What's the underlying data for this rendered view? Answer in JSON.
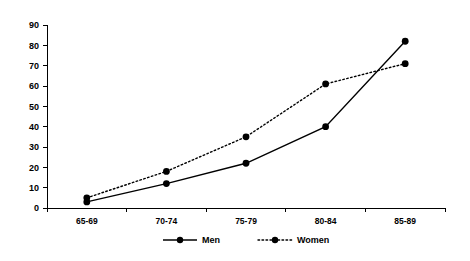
{
  "chart_data": {
    "type": "line",
    "title": "",
    "xlabel": "",
    "ylabel": "",
    "categories": [
      "65-69",
      "70-74",
      "75-79",
      "80-84",
      "85-89"
    ],
    "series": [
      {
        "name": "Men",
        "values": [
          3,
          12,
          22,
          40,
          82
        ],
        "style": "solid",
        "marker": "filled-circle",
        "color": "#000000"
      },
      {
        "name": "Women",
        "values": [
          5,
          18,
          35,
          61,
          71
        ],
        "style": "dotted",
        "marker": "filled-circle",
        "color": "#000000"
      }
    ],
    "ylim": [
      0,
      90
    ],
    "ytick_labels": [
      "0",
      "10",
      "20",
      "30",
      "40",
      "50",
      "60",
      "70",
      "80",
      "90"
    ],
    "ytick_values": [
      0,
      10,
      20,
      30,
      40,
      50,
      60,
      70,
      80,
      90
    ],
    "grid": false,
    "legend_position": "bottom"
  },
  "legend": {
    "entries": [
      {
        "label": "Men",
        "style": "solid"
      },
      {
        "label": "Women",
        "style": "dotted"
      }
    ]
  }
}
